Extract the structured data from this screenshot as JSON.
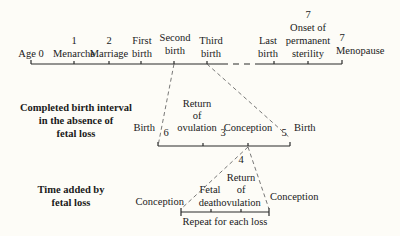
{
  "diagram": {
    "top_timeline": {
      "events": [
        {
          "number": "",
          "label": "Age 0"
        },
        {
          "number": "1",
          "label": "Menarche"
        },
        {
          "number": "2",
          "label": "Marriage"
        },
        {
          "number": "",
          "label_line1": "First",
          "label_line2": "birth"
        },
        {
          "number": "",
          "label_line1": "Second",
          "label_line2": "birth"
        },
        {
          "number": "",
          "label_line1": "Third",
          "label_line2": "birth"
        },
        {
          "number": "",
          "label_line1": "Last",
          "label_line2": "birth"
        },
        {
          "number": "7",
          "label_line1": "Onset of",
          "label_line2": "permanent",
          "label_line3": "sterility"
        },
        {
          "number": "7",
          "label": "Menopause"
        }
      ]
    },
    "birth_interval": {
      "title_line1": "Completed birth interval",
      "title_line2": "in the absence of",
      "title_line3": "fetal loss",
      "start_label": "Birth",
      "segment_numbers": [
        "6",
        "3",
        "5"
      ],
      "return_line1": "Return",
      "return_line2": "of",
      "return_line3": "ovulation",
      "conception_label": "Conception",
      "end_label": "Birth",
      "branch_number": "4"
    },
    "fetal_loss": {
      "title_line1": "Time added by",
      "title_line2": "fetal loss",
      "start_label": "Conception",
      "fetal_line1": "Fetal",
      "fetal_line2": "death",
      "return_line1": "Return",
      "return_line2": "of",
      "return_line3": "ovulation",
      "end_label": "Conception",
      "bracket_label": "Repeat for each loss"
    }
  }
}
